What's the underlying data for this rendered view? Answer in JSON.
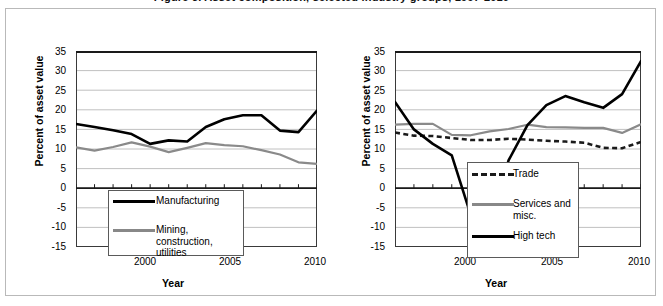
{
  "figure": {
    "title_partial": "Figure 3. Asset composition, selected industry groups, 1997-2010"
  },
  "axes": {
    "ylabel": "Percent of asset value",
    "xlabel": "Year",
    "yticks": [
      35,
      30,
      25,
      20,
      15,
      10,
      5,
      0,
      -5,
      -10,
      -15
    ],
    "xticks": [
      2000,
      2005,
      2010
    ],
    "ylim": [
      -15,
      35
    ],
    "xlim": [
      1997,
      2010
    ]
  },
  "chart_data": [
    {
      "type": "line",
      "panel": "left",
      "title": "",
      "xlabel": "Year",
      "ylabel": "Percent of asset value",
      "ylim": [
        -15,
        35
      ],
      "xlim": [
        1997,
        2010
      ],
      "grid": true,
      "legend_position": "bottom-center",
      "x": [
        1997,
        1998,
        1999,
        2000,
        2001,
        2002,
        2003,
        2004,
        2005,
        2006,
        2007,
        2008,
        2009,
        2010
      ],
      "series": [
        {
          "name": "Manufacturing",
          "color": "#000000",
          "style": "solid",
          "values": [
            16.4,
            15.6,
            14.8,
            13.8,
            11.3,
            12.2,
            11.9,
            15.6,
            17.6,
            18.6,
            18.6,
            14.7,
            14.3,
            19.8
          ]
        },
        {
          "name": "Mining, construction, utilities",
          "color": "#8a8a8a",
          "style": "solid",
          "values": [
            10.4,
            9.6,
            10.5,
            11.7,
            10.6,
            9.2,
            10.3,
            11.5,
            11.0,
            10.7,
            9.7,
            8.6,
            6.6,
            6.2
          ]
        }
      ]
    },
    {
      "type": "line",
      "panel": "right",
      "title": "",
      "xlabel": "Year",
      "ylabel": "Percent of asset value",
      "ylim": [
        -15,
        35
      ],
      "xlim": [
        1997,
        2010
      ],
      "grid": true,
      "legend_position": "bottom-right",
      "x": [
        1997,
        1998,
        1999,
        2000,
        2001,
        2002,
        2003,
        2004,
        2005,
        2006,
        2007,
        2008,
        2009,
        2010
      ],
      "series": [
        {
          "name": "Trade",
          "color": "#1a1a1a",
          "style": "dashed",
          "values": [
            14.2,
            13.4,
            13.3,
            12.8,
            12.3,
            12.3,
            12.6,
            12.4,
            12.1,
            11.9,
            11.6,
            10.3,
            10.2,
            11.8
          ]
        },
        {
          "name": "Services and misc.",
          "color": "#8a8a8a",
          "style": "solid",
          "values": [
            16.2,
            16.4,
            16.4,
            13.6,
            13.5,
            14.5,
            15.1,
            16.2,
            15.6,
            15.5,
            15.4,
            15.4,
            14.1,
            16.3
          ]
        },
        {
          "name": "High tech",
          "color": "#000000",
          "style": "solid",
          "values": [
            22.0,
            15.0,
            11.3,
            8.4,
            -6.8,
            -10.1,
            7.1,
            16.1,
            21.2,
            23.5,
            21.9,
            20.5,
            24.0,
            32.4
          ]
        }
      ]
    }
  ]
}
